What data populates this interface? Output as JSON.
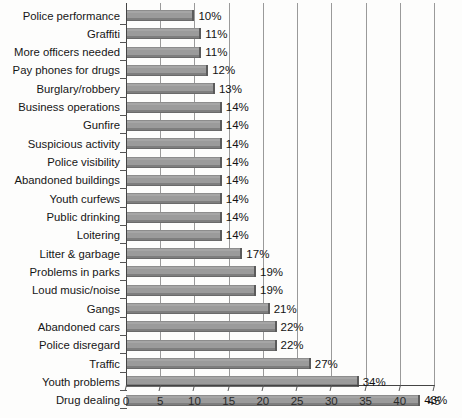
{
  "chart_data": {
    "type": "bar",
    "orientation": "horizontal",
    "title": "",
    "subtitle": "",
    "xlabel": "",
    "ylabel": "",
    "xlim": [
      0,
      45
    ],
    "xticks": [
      0,
      5,
      10,
      15,
      20,
      25,
      30,
      35,
      40,
      45
    ],
    "xtick_labels": [
      "0",
      "5",
      "10",
      "15",
      "20",
      "25",
      "30",
      "35",
      "40",
      "45"
    ],
    "grid": "vertical",
    "legend": "none",
    "value_suffix": "%",
    "categories": [
      "Police performance",
      "Graffiti",
      "More officers needed",
      "Pay phones for drugs",
      "Burglary/robbery",
      "Business operations",
      "Gunfire",
      "Suspicious activity",
      "Police visibility",
      "Abandoned buildings",
      "Youth curfews",
      "Public drinking",
      "Loitering",
      "Litter & garbage",
      "Problems in parks",
      "Loud music/noise",
      "Gangs",
      "Abandoned cars",
      "Police disregard",
      "Traffic",
      "Youth problems",
      "Drug dealing"
    ],
    "values": [
      10,
      11,
      11,
      12,
      13,
      14,
      14,
      14,
      14,
      14,
      14,
      14,
      14,
      17,
      19,
      19,
      21,
      22,
      22,
      27,
      34,
      43
    ],
    "data_labels": [
      "10%",
      "11%",
      "11%",
      "12%",
      "13%",
      "14%",
      "14%",
      "14%",
      "14%",
      "14%",
      "14%",
      "14%",
      "14%",
      "17%",
      "19%",
      "19%",
      "21%",
      "22%",
      "22%",
      "27%",
      "34%",
      "43%"
    ],
    "colors": {
      "bar_fill": "#9b9b9b",
      "bar_edge": "#5b5b5b",
      "gridline": "#9a9a9a",
      "axis": "#444444",
      "background": "#fdfdfc",
      "text": "#161616"
    }
  }
}
